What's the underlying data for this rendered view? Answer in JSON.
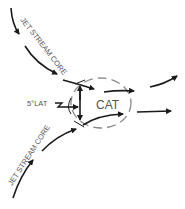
{
  "diagram": {
    "labels": {
      "upper_jet": "JET STREAM CORE",
      "lower_jet": "JET STREAM CORE",
      "lat_distance": "5°LAT",
      "cat": "CAT"
    },
    "colors": {
      "arrow": "#1a1a1a",
      "ellipse": "#8a8a8a",
      "text": "#555555",
      "background": "#ffffff"
    }
  }
}
